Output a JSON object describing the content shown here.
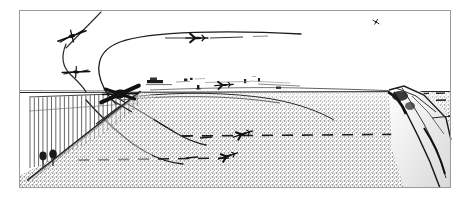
{
  "illustration": {
    "title": "Airfield approach and departure flight-path diagram",
    "medium": "monochrome halftone line drawing",
    "background_color": "#ffffff",
    "ink_color": "#111111",
    "frame": {
      "name": "picture-frame-border",
      "x": 19,
      "y": 10,
      "width": 432,
      "height": 178,
      "stroke_color": "#9a9a9a",
      "stroke_width": 1
    },
    "sky": {
      "name": "sky-region",
      "color": "#ffffff",
      "horizon_y": 92
    },
    "ground": {
      "name": "stippled-ground-plain",
      "texture": "stipple",
      "tone_color": "#8c8c8c",
      "top_y": 92,
      "bottom_y": 188
    },
    "horizon_line": {
      "name": "horizon-line",
      "from_x": 19,
      "to_x": 451,
      "y": 92,
      "color": "#222222"
    },
    "aircraft": [
      {
        "id": "ac-1",
        "name": "aircraft-head-on-upper-left",
        "view": "head-on",
        "x": 72,
        "y": 36,
        "scale": 1.0,
        "rotation_deg": -14,
        "label": "climbing aircraft, head-on view"
      },
      {
        "id": "ac-2",
        "name": "aircraft-head-on-mid-left",
        "view": "head-on",
        "x": 76,
        "y": 72,
        "scale": 0.92,
        "rotation_deg": 4,
        "label": "second aircraft on turn, head-on view"
      },
      {
        "id": "ac-3",
        "name": "aircraft-crossing-fence",
        "view": "three-quarter",
        "x": 120,
        "y": 94,
        "scale": 1.25,
        "rotation_deg": -10,
        "label": "dark aircraft crossing boundary fence"
      },
      {
        "id": "ac-4",
        "name": "aircraft-level-upper-middle",
        "view": "plan",
        "x": 197,
        "y": 38,
        "scale": 0.85,
        "rotation_deg": 0,
        "label": "aircraft in level cruise with trail line"
      },
      {
        "id": "ac-5",
        "name": "aircraft-distant-upper-right",
        "view": "banking",
        "x": 376,
        "y": 22,
        "scale": 0.5,
        "rotation_deg": 30,
        "label": "distant small aircraft, high right"
      },
      {
        "id": "ac-6",
        "name": "aircraft-on-runway-horizon",
        "view": "plan",
        "x": 224,
        "y": 85,
        "scale": 0.72,
        "rotation_deg": -4,
        "label": "aircraft on the airfield at horizon"
      },
      {
        "id": "ac-7",
        "name": "aircraft-landing-upper",
        "view": "plan",
        "x": 243,
        "y": 134,
        "scale": 0.78,
        "rotation_deg": -18,
        "label": "aircraft on lower dashed track, upper"
      },
      {
        "id": "ac-8",
        "name": "aircraft-landing-lower",
        "view": "plan",
        "x": 228,
        "y": 156,
        "scale": 0.78,
        "rotation_deg": -18,
        "label": "aircraft on lower dashed track, lower"
      }
    ],
    "flight_paths": [
      {
        "id": "path-1",
        "name": "flight-path-climb-out",
        "style": "solid",
        "description": "steep straight climb line from upper-left aircraft"
      },
      {
        "id": "path-2",
        "name": "flight-path-procedure-turn",
        "style": "solid",
        "description": "tight descending arc linking the two left aircraft"
      },
      {
        "id": "path-3",
        "name": "flight-path-downwind-u-turn",
        "style": "solid",
        "description": "large U-shaped reversal arc across the upper sky"
      },
      {
        "id": "path-4",
        "name": "flight-path-final-descent-a",
        "style": "solid",
        "description": "long descending curve sweeping right to the ground"
      },
      {
        "id": "path-5",
        "name": "flight-path-final-descent-b",
        "style": "solid",
        "description": "second descending curve below the first"
      },
      {
        "id": "path-6",
        "name": "flight-path-cruise-trail",
        "style": "solid",
        "description": "horizontal trail line through the level aircraft"
      }
    ],
    "dashed_tracks": [
      {
        "id": "dash-1",
        "name": "dashed-ground-track-upper",
        "y": 136,
        "from_x": 180,
        "to_x": 448,
        "description": "upper dashed ground track to the ridge"
      },
      {
        "id": "dash-2",
        "name": "dashed-ground-track-lower",
        "y": 159,
        "from_x": 78,
        "to_x": 232,
        "description": "lower dashed ground track from the fence line"
      },
      {
        "id": "dash-3",
        "name": "dashed-ground-track-right",
        "y": 117,
        "from_x": 394,
        "to_x": 450,
        "description": "short dashed marker on the ridge flank"
      },
      {
        "id": "dash-4",
        "name": "dashed-ground-track-ridge-top",
        "y": 101,
        "from_x": 400,
        "to_x": 450,
        "description": "dashed marker above the ridge"
      }
    ],
    "scenery": [
      {
        "id": "fence",
        "name": "picket-fence",
        "description": "vertical picket fence / hatched boundary at left",
        "x": 28,
        "y": 96,
        "width": 112,
        "height": 70,
        "picket_count": 26
      },
      {
        "id": "hillside",
        "name": "foreground-hillside-slope",
        "description": "dark sloping bank running down to lower-left corner"
      },
      {
        "id": "tree-1",
        "name": "tree-left",
        "x": 43,
        "y": 157
      },
      {
        "id": "tree-2",
        "name": "tree-right",
        "x": 53,
        "y": 155
      },
      {
        "id": "ridge",
        "name": "ridge-escarpment-right",
        "description": "rocky ridge / escarpment rising at the right edge",
        "x": 380,
        "y": 88,
        "width": 70,
        "height": 100
      },
      {
        "id": "buildings",
        "name": "airfield-buildings-horizon",
        "description": "cluster of small buildings and markers along the horizon",
        "from_x": 146,
        "to_x": 300,
        "y": 80
      }
    ]
  }
}
